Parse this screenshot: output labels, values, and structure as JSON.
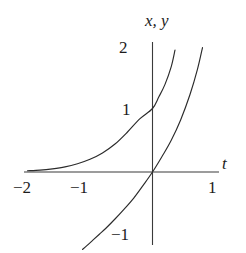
{
  "figure": {
    "background_color": "#ffffff",
    "ink_color": "#2b2b2b",
    "axis_titles": {
      "vertical": "x, y",
      "horizontal": "t"
    },
    "tick_labels": {
      "y": [
        "2",
        "1",
        "−1"
      ],
      "x": [
        "−2",
        "−1",
        "1"
      ]
    }
  },
  "chart_data": {
    "type": "line",
    "title": "",
    "subtitle": "",
    "xlabel": "t",
    "ylabel": "x, y",
    "xlim": [
      -2.05,
      1.05
    ],
    "ylim": [
      -1.35,
      2.1
    ],
    "xticks": [
      -2,
      -1,
      1
    ],
    "xticklabels": [
      "−2",
      "−1",
      "1"
    ],
    "yticks": [
      2,
      1,
      -1
    ],
    "yticklabels": [
      "2",
      "1",
      "−1"
    ],
    "grid": false,
    "legend": null,
    "legend_position": "none",
    "axes_style": "centered-cross",
    "annotations": [],
    "series": [
      {
        "name": "x",
        "description": "exponential curve through (0, 1), asymptotic to the t-axis at left",
        "color": "#2b2b2b",
        "x": [
          -2.0,
          -1.8,
          -1.6,
          -1.4,
          -1.2,
          -1.0,
          -0.8,
          -0.6,
          -0.4,
          -0.2,
          0.0,
          0.1,
          0.2,
          0.3,
          0.36
        ],
        "y": [
          0.02,
          0.03,
          0.05,
          0.08,
          0.13,
          0.2,
          0.3,
          0.44,
          0.63,
          0.84,
          1.0,
          1.18,
          1.38,
          1.66,
          1.92
        ]
      },
      {
        "name": "y",
        "description": "curve through the origin, falling to about (−1.1, −1.2) and rising steeply to the right",
        "color": "#2b2b2b",
        "x": [
          -1.12,
          -1.05,
          -0.95,
          -0.85,
          -0.75,
          -0.6,
          -0.45,
          -0.3,
          -0.15,
          0.0,
          0.15,
          0.3,
          0.45,
          0.6,
          0.72,
          0.8
        ],
        "y": [
          -1.22,
          -1.16,
          -1.07,
          -0.98,
          -0.89,
          -0.74,
          -0.58,
          -0.41,
          -0.21,
          0.0,
          0.24,
          0.5,
          0.82,
          1.22,
          1.62,
          1.96
        ]
      }
    ]
  }
}
